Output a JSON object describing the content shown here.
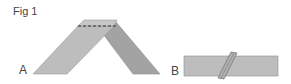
{
  "figure": {
    "title": "Fig 1",
    "panels": [
      {
        "label": "A",
        "description": "Strip folded at an angle forming an inverted V with dashed fold line at top"
      },
      {
        "label": "B",
        "description": "Flat rectangular strip with a narrow diagonal folded band across it"
      }
    ]
  },
  "colors": {
    "strip_light": "#bdbdbd",
    "strip_dark": "#9e9e9e",
    "outline": "#8a8a8a",
    "dash": "#333333",
    "text": "#444444"
  }
}
